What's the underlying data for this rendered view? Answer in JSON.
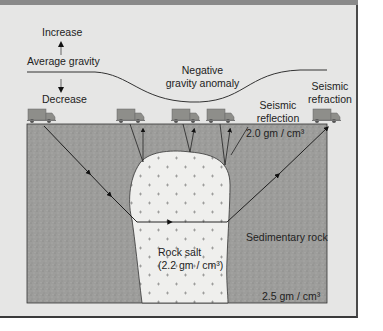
{
  "diagram": {
    "type": "geophysical cross-section: gravity anomaly and seismic surveys over a salt dome",
    "gravity_profile": {
      "increase_label": "Increase",
      "average_label": "Average gravity",
      "decrease_label": "Decrease",
      "anomaly_label_line1": "Negative",
      "anomaly_label_line2": "gravity anomaly"
    },
    "seismic": {
      "reflection_line1": "Seismic",
      "reflection_line2": "reflection",
      "refraction_line1": "Seismic",
      "refraction_line2": "refraction"
    },
    "layers": {
      "upper_density": "2.0 gm / cm³",
      "sedimentary_label": "Sedimentary rock",
      "lower_density": "2.5 gm / cm³",
      "salt_label_line1": "Rock salt",
      "salt_label_line2": "(2.2 gm / cm³)"
    },
    "trucks": 5,
    "colors": {
      "background": "#e6e6e5",
      "ground": "#9c9c9a",
      "salt": "#efefed",
      "truck": "#8d8d89",
      "line": "#222222"
    }
  }
}
